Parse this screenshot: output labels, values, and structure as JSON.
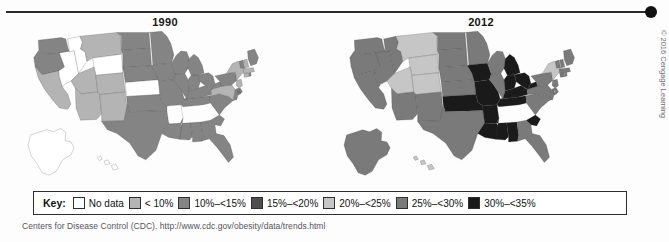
{
  "figure": {
    "panels": [
      {
        "title": "1990",
        "year": 1990
      },
      {
        "title": "2012",
        "year": 2012
      }
    ]
  },
  "legend": {
    "label": "Key:",
    "items": [
      {
        "text": "No data",
        "color": "#ffffff"
      },
      {
        "text": "< 10%",
        "color": "#b4b4b4"
      },
      {
        "text": "10%–<15%",
        "color": "#848484"
      },
      {
        "text": "15%–<20%",
        "color": "#4e4e4e"
      },
      {
        "text": "20%–<25%",
        "color": "#c6c6c6"
      },
      {
        "text": "25%–<30%",
        "color": "#7a7a7a"
      },
      {
        "text": "30%–<35%",
        "color": "#1a1a1a"
      }
    ]
  },
  "source": "Centers for Disease Control (CDC). http://www.cdc.gov/obesity/data/trends.html",
  "credit": "© 2016 Cengage Learning",
  "chart_data": {
    "type": "choropleth",
    "subtitle": "",
    "legend_position": "bottom",
    "bins": [
      {
        "label": "No data",
        "color": "#ffffff"
      },
      {
        "label": "< 10%",
        "color": "#b4b4b4"
      },
      {
        "label": "10%–<15%",
        "color": "#848484"
      },
      {
        "label": "15%–<20%",
        "color": "#4e4e4e"
      },
      {
        "label": "20%–<25%",
        "color": "#c6c6c6"
      },
      {
        "label": "25%–<30%",
        "color": "#7a7a7a"
      },
      {
        "label": "30%–<35%",
        "color": "#1a1a1a"
      }
    ],
    "maps": [
      {
        "year": 1990,
        "values": {
          "AK": "No data",
          "AL": "10%–<15%",
          "AR": "No data",
          "AZ": "< 10%",
          "CA": "< 10%",
          "CO": "< 10%",
          "CT": "< 10%",
          "DC": "10%–<15%",
          "DE": "10%–<15%",
          "FL": "10%–<15%",
          "GA": "10%–<15%",
          "HI": "No data",
          "IA": "10%–<15%",
          "ID": "No data",
          "IL": "10%–<15%",
          "IN": "10%–<15%",
          "KS": "No data",
          "KY": "10%–<15%",
          "LA": "10%–<15%",
          "MA": "< 10%",
          "MD": "10%–<15%",
          "ME": "10%–<15%",
          "MI": "10%–<15%",
          "MN": "10%–<15%",
          "MO": "10%–<15%",
          "MS": "10%–<15%",
          "MT": "< 10%",
          "NC": "10%–<15%",
          "ND": "10%–<15%",
          "NE": "10%–<15%",
          "NH": "< 10%",
          "NJ": "< 10%",
          "NM": "< 10%",
          "NV": "No data",
          "NY": "< 10%",
          "OH": "10%–<15%",
          "OK": "10%–<15%",
          "OR": "10%–<15%",
          "PA": "10%–<15%",
          "RI": "10%–<15%",
          "SC": "10%–<15%",
          "SD": "10%–<15%",
          "TN": "10%–<15%",
          "TX": "10%–<15%",
          "UT": "< 10%",
          "VA": "< 10%",
          "VT": "10%–<15%",
          "WA": "10%–<15%",
          "WI": "10%–<15%",
          "WV": "10%–<15%",
          "WY": "No data"
        }
      },
      {
        "year": 2012,
        "values": {
          "AK": "25%–<30%",
          "AL": "30%–<35%",
          "AR": "30%–<35%",
          "AZ": "25%–<30%",
          "CA": "25%–<30%",
          "CO": "20%–<25%",
          "CT": "25%–<30%",
          "DC": "20%–<25%",
          "DE": "25%–<30%",
          "FL": "25%–<30%",
          "GA": "25%–<30%",
          "HI": "20%–<25%",
          "IA": "30%–<35%",
          "ID": "25%–<30%",
          "IL": "25%–<30%",
          "IN": "30%–<35%",
          "KS": "25%–<30%",
          "KY": "30%–<35%",
          "LA": "30%–<35%",
          "MA": "25%–<30%",
          "MD": "25%–<30%",
          "ME": "25%–<30%",
          "MI": "30%–<35%",
          "MN": "25%–<30%",
          "MO": "30%–<35%",
          "MS": "30%–<35%",
          "MT": "20%–<25%",
          "NC": "25%–<30%",
          "ND": "25%–<30%",
          "NE": "25%–<30%",
          "NH": "25%–<30%",
          "NJ": "25%–<30%",
          "NM": "25%–<30%",
          "NV": "25%–<30%",
          "NY": "20%–<25%",
          "OH": "30%–<35%",
          "OK": "30%–<35%",
          "OR": "25%–<30%",
          "PA": "25%–<30%",
          "RI": "25%–<30%",
          "SC": "30%–<35%",
          "SD": "25%–<30%",
          "TN": "30%–<35%",
          "TX": "25%–<30%",
          "UT": "20%–<25%",
          "VA": "25%–<30%",
          "VT": "25%–<30%",
          "WA": "25%–<30%",
          "WI": "25%–<30%",
          "WV": "30%–<35%",
          "WY": "20%–<25%"
        }
      }
    ]
  }
}
